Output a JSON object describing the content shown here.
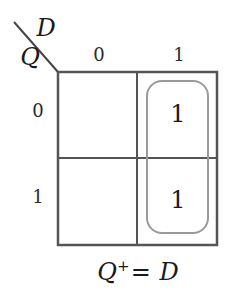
{
  "diagram": {
    "type": "karnaugh-map",
    "column_variable": "D",
    "row_variable": "Q",
    "column_labels": [
      "0",
      "1"
    ],
    "row_labels": [
      "0",
      "1"
    ],
    "cells": [
      [
        "",
        "1"
      ],
      [
        "",
        "1"
      ]
    ],
    "groups": [
      {
        "cells": [
          [
            0,
            1
          ],
          [
            1,
            1
          ]
        ],
        "color": "#999999"
      }
    ],
    "equation": {
      "lhs": "Q",
      "superscript": "+",
      "equals": "=",
      "rhs": "D"
    },
    "colors": {
      "grid": "#555555",
      "group_loop": "#9a9a9a",
      "text": "#1a1a1a"
    }
  }
}
